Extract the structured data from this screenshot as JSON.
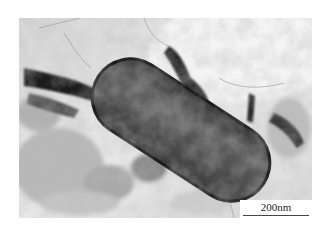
{
  "figure": {
    "scale_bar": {
      "label": "200nm"
    }
  },
  "colors": {
    "background": "#ffffff",
    "particle": "#4a4a4a",
    "matrix_light": "#e6e6e6",
    "matrix_dark": "#2a2a2a"
  }
}
